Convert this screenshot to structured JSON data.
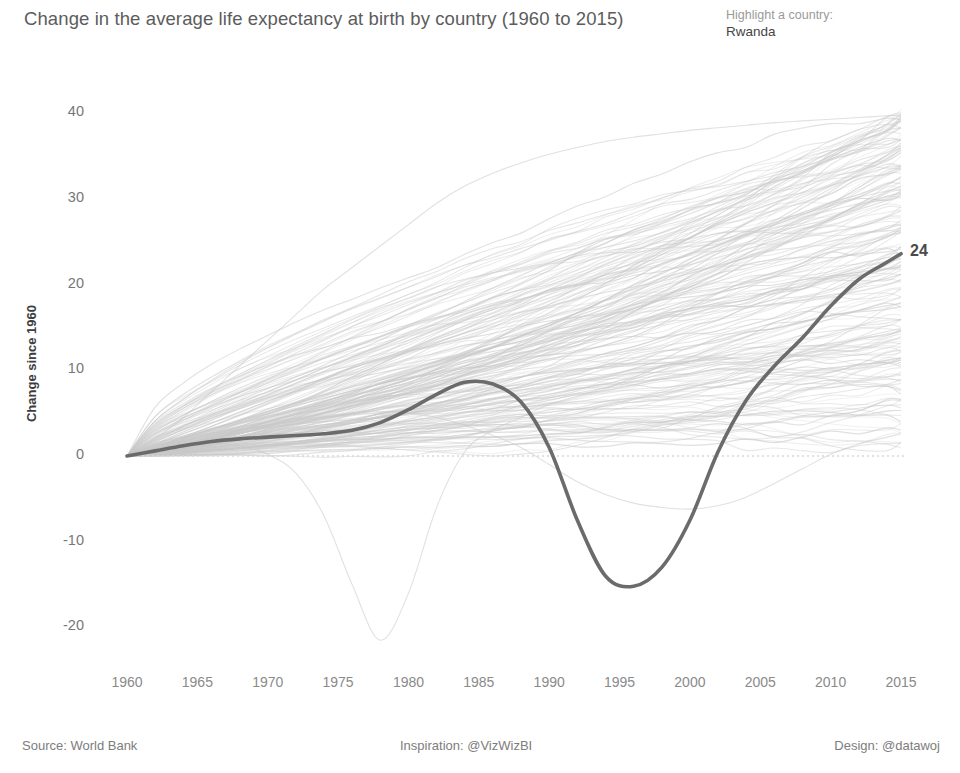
{
  "header": {
    "title": "Change in the average life expectancy at birth by country (1960 to 2015)",
    "highlight_prompt": "Highlight a country:",
    "highlight_value": "Rwanda"
  },
  "footer": {
    "source": "Source: World Bank",
    "inspiration": "Inspiration: @VizWizBI",
    "design": "Design: @datawoj"
  },
  "axes": {
    "y_title": "Change since 1960",
    "y_ticks": [
      "40",
      "30",
      "20",
      "10",
      "0",
      "-10",
      "-20"
    ],
    "x_ticks": [
      "1960",
      "1965",
      "1970",
      "1975",
      "1980",
      "1985",
      "1990",
      "1995",
      "2000",
      "2005",
      "2010",
      "2015"
    ]
  },
  "annotations": {
    "end_value": "24"
  },
  "colors": {
    "background": "#ffffff",
    "title_text": "#5c5c5c",
    "tick_text": "#8a8a8a",
    "highlight_line": "#6b6b6b",
    "background_line": "#c9c9c9",
    "zero_line": "#d8d8d8",
    "end_label": "#4a4a4a"
  },
  "chart_data": {
    "type": "line",
    "title": "Change in the average life expectancy at birth by country (1960 to 2015)",
    "xlabel": "",
    "ylabel": "Change since 1960",
    "xlim": [
      1960,
      2015
    ],
    "ylim": [
      -24,
      42
    ],
    "grid": false,
    "legend": "none",
    "zero_reference_line": 0,
    "x": [
      1960,
      1962,
      1964,
      1966,
      1968,
      1970,
      1972,
      1974,
      1976,
      1978,
      1980,
      1982,
      1984,
      1986,
      1988,
      1990,
      1992,
      1994,
      1996,
      1998,
      2000,
      2002,
      2004,
      2006,
      2008,
      2010,
      2012,
      2014,
      2015
    ],
    "highlighted_series": {
      "name": "Rwanda",
      "end_label": "24",
      "values": [
        0,
        0.6,
        1.2,
        1.7,
        2.0,
        2.2,
        2.4,
        2.6,
        3.0,
        3.9,
        5.4,
        7.2,
        8.6,
        8.4,
        6.3,
        1.0,
        -7.5,
        -14.0,
        -15.2,
        -13.0,
        -7.5,
        0.5,
        6.5,
        10.5,
        13.8,
        17.5,
        20.6,
        22.6,
        23.6
      ]
    },
    "background_series_note": "Approximately 200 country trajectories drawn in light gray, all anchored at 0 in 1960 and fanning upward to roughly +2 to +40 by 2015; a small number dip below zero (notably one reaching about -21.5 around 1977 and another near -6 around 2002).",
    "background_series": [
      {
        "name": "outlier-top",
        "values": [
          0,
          2.0,
          4.5,
          7.5,
          10.5,
          13.5,
          16.5,
          19.5,
          22.0,
          24.5,
          27.0,
          29.5,
          31.5,
          33.0,
          34.2,
          35.2,
          36.0,
          36.7,
          37.2,
          37.6,
          38.0,
          38.3,
          38.6,
          38.9,
          39.1,
          39.3,
          39.5,
          39.7,
          39.8
        ]
      },
      {
        "name": "outlier-deep-dip",
        "values": [
          0,
          0.5,
          1.0,
          1.5,
          1.2,
          0.2,
          -2.0,
          -7.0,
          -15.0,
          -21.5,
          -16.0,
          -6.0,
          0.5,
          3.0,
          4.5,
          6.0,
          7.0,
          8.0,
          9.0,
          10.0,
          11.0,
          12.0,
          13.0,
          14.0,
          15.0,
          16.0,
          17.0,
          18.0,
          18.5
        ]
      },
      {
        "name": "outlier-late-dip",
        "values": [
          0,
          0.8,
          1.6,
          2.4,
          3.0,
          3.6,
          4.2,
          4.6,
          5.0,
          5.2,
          5.0,
          4.5,
          3.6,
          2.4,
          1.0,
          -1.0,
          -3.0,
          -4.5,
          -5.5,
          -6.0,
          -6.2,
          -5.8,
          -4.8,
          -3.2,
          -1.5,
          0.2,
          1.4,
          2.2,
          2.6
        ]
      }
    ],
    "value_range_2015": [
      2,
      40
    ]
  }
}
